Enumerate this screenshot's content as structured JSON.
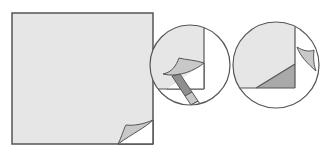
{
  "diagram": {
    "type": "instructional-illustration",
    "colors": {
      "sheet": "#e6e6e6",
      "outline": "#555555",
      "fold": "#c8c8c8",
      "fold_dark": "#a9a9a9",
      "tool": "#8f8f8f",
      "background": "#ffffff"
    },
    "panels": [
      {
        "id": "sheet",
        "label": "Square sheet with lifted bottom-right corner"
      },
      {
        "id": "detail-1",
        "label": "Magnified view: tool lifting corner"
      },
      {
        "id": "detail-2",
        "label": "Magnified view: corner folded back"
      }
    ]
  }
}
